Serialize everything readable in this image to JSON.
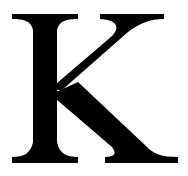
{
  "letter": {
    "character": "K",
    "style": "serif capital letter",
    "fill_color": "#000000",
    "background_color": "#ffffff"
  }
}
